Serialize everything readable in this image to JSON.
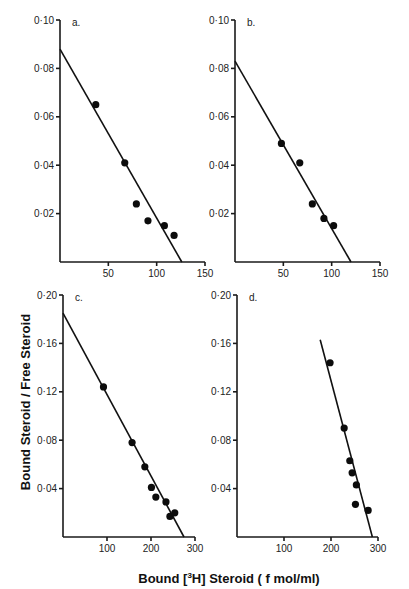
{
  "figure": {
    "xlabel": "Bound [3H] Steroid ( f mol/ml)",
    "xlabel_parts": {
      "before": "Bound ",
      "bracket_sup": "3",
      "bracket_el": "H",
      "after": " Steroid  ( f mol/ml)"
    },
    "ylabel": "Bound Steroid / Free Steroid"
  },
  "chart_data": [
    {
      "type": "scatter",
      "panel": "a.",
      "title": "a.",
      "xlabel": "Bound [3H] Steroid (f mol/ml)",
      "ylabel": "Bound Steroid / Free Steroid",
      "xlim": [
        0,
        150
      ],
      "ylim": [
        0,
        0.1
      ],
      "xticks": [
        50,
        100,
        150
      ],
      "xtick_labels": [
        "50",
        "100",
        "150"
      ],
      "yticks": [
        0.02,
        0.04,
        0.06,
        0.08,
        0.1
      ],
      "ytick_labels": [
        "0·02",
        "0·04",
        "0·06",
        "0·08",
        "0·10"
      ],
      "grid": false,
      "points": [
        {
          "x": 37,
          "y": 0.065
        },
        {
          "x": 67,
          "y": 0.041
        },
        {
          "x": 79,
          "y": 0.024
        },
        {
          "x": 91,
          "y": 0.017
        },
        {
          "x": 108,
          "y": 0.015
        },
        {
          "x": 118,
          "y": 0.011
        }
      ],
      "fit_line": {
        "x1": 0,
        "y1": 0.088,
        "x2": 126,
        "y2": 0.0
      }
    },
    {
      "type": "scatter",
      "panel": "b.",
      "title": "b.",
      "xlabel": "Bound [3H] Steroid (f mol/ml)",
      "ylabel": "Bound Steroid / Free Steroid",
      "xlim": [
        0,
        150
      ],
      "ylim": [
        0,
        0.1
      ],
      "xticks": [
        50,
        100,
        150
      ],
      "xtick_labels": [
        "50",
        "100",
        "150"
      ],
      "yticks": [
        0.02,
        0.04,
        0.06,
        0.08,
        0.1
      ],
      "ytick_labels": [
        "0·02",
        "0·04",
        "0·06",
        "0·08",
        "0·10"
      ],
      "grid": false,
      "points": [
        {
          "x": 48,
          "y": 0.049
        },
        {
          "x": 67,
          "y": 0.041
        },
        {
          "x": 80,
          "y": 0.024
        },
        {
          "x": 92,
          "y": 0.018
        },
        {
          "x": 102,
          "y": 0.015
        }
      ],
      "fit_line": {
        "x1": 0,
        "y1": 0.083,
        "x2": 120,
        "y2": 0.0
      }
    },
    {
      "type": "scatter",
      "panel": "c.",
      "title": "c.",
      "xlabel": "Bound [3H] Steroid (f mol/ml)",
      "ylabel": "Bound Steroid / Free Steroid",
      "xlim": [
        0,
        300
      ],
      "ylim": [
        0,
        0.2
      ],
      "xticks": [
        100,
        200,
        300
      ],
      "xtick_labels": [
        "100",
        "200",
        "300"
      ],
      "yticks": [
        0.04,
        0.08,
        0.12,
        0.16,
        0.2
      ],
      "ytick_labels": [
        "0·04",
        "0·08",
        "0·12",
        "0·16",
        "0·20"
      ],
      "grid": false,
      "points": [
        {
          "x": 92,
          "y": 0.124
        },
        {
          "x": 157,
          "y": 0.078
        },
        {
          "x": 186,
          "y": 0.058
        },
        {
          "x": 201,
          "y": 0.041
        },
        {
          "x": 211,
          "y": 0.033
        },
        {
          "x": 234,
          "y": 0.029
        },
        {
          "x": 243,
          "y": 0.017
        },
        {
          "x": 254,
          "y": 0.02
        }
      ],
      "fit_line": {
        "x1": 0,
        "y1": 0.185,
        "x2": 275,
        "y2": 0.0
      }
    },
    {
      "type": "scatter",
      "panel": "d.",
      "title": "d.",
      "xlabel": "Bound [3H] Steroid (f mol/ml)",
      "ylabel": "Bound Steroid / Free Steroid",
      "xlim": [
        0,
        300
      ],
      "ylim": [
        0,
        0.2
      ],
      "xticks": [
        100,
        200,
        300
      ],
      "xtick_labels": [
        "100",
        "200",
        "300"
      ],
      "yticks": [
        0.04,
        0.08,
        0.12,
        0.16,
        0.2
      ],
      "ytick_labels": [
        "0·04",
        "0·08",
        "0·12",
        "0·16",
        "0·20"
      ],
      "grid": false,
      "points": [
        {
          "x": 198,
          "y": 0.144
        },
        {
          "x": 228,
          "y": 0.09
        },
        {
          "x": 240,
          "y": 0.063
        },
        {
          "x": 245,
          "y": 0.053
        },
        {
          "x": 254,
          "y": 0.043
        },
        {
          "x": 252,
          "y": 0.027
        },
        {
          "x": 279,
          "y": 0.022
        }
      ],
      "fit_line": {
        "x1": 177,
        "y1": 0.163,
        "x2": 288,
        "y2": 0.0
      }
    }
  ]
}
